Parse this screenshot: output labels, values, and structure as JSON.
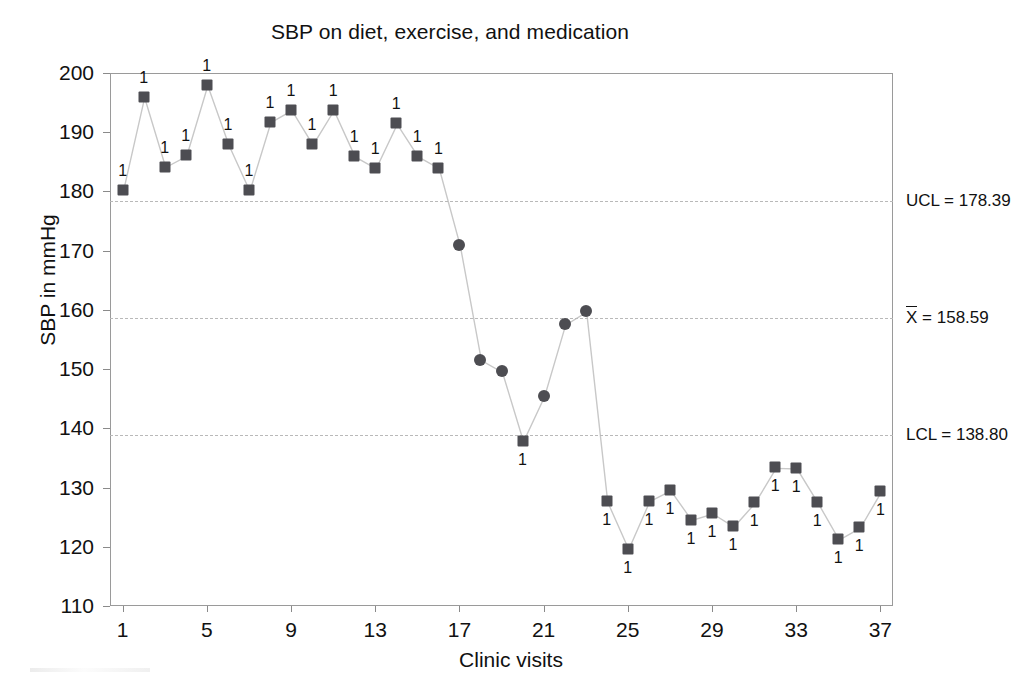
{
  "chart_data": {
    "type": "line",
    "title": "SBP on diet, exercise, and medication",
    "xlabel": "Clinic visits",
    "ylabel": "SBP in mmHg",
    "grid": false,
    "legend": "none",
    "xlim": [
      0.4,
      37.6
    ],
    "ylim": [
      110,
      200
    ],
    "x_ticks": [
      1,
      5,
      9,
      13,
      17,
      21,
      25,
      29,
      33,
      37
    ],
    "y_ticks": [
      110,
      120,
      130,
      140,
      150,
      160,
      170,
      180,
      190,
      200
    ],
    "x": [
      1,
      2,
      3,
      4,
      5,
      6,
      7,
      8,
      9,
      10,
      11,
      12,
      13,
      14,
      15,
      16,
      17,
      18,
      19,
      20,
      21,
      22,
      23,
      24,
      25,
      26,
      27,
      28,
      29,
      30,
      31,
      32,
      33,
      34,
      35,
      36,
      37
    ],
    "values": [
      180.3,
      196.0,
      184.2,
      186.1,
      198.0,
      188.0,
      180.2,
      191.8,
      193.8,
      188.0,
      193.8,
      186.0,
      184.0,
      191.5,
      186.0,
      184.0,
      170.9,
      151.6,
      149.6,
      137.9,
      145.5,
      157.6,
      159.8,
      127.7,
      119.7,
      127.8,
      129.6,
      124.6,
      125.7,
      123.5,
      127.5,
      133.4,
      133.3,
      127.5,
      121.3,
      123.3,
      129.4
    ],
    "point_types": [
      "square",
      "square",
      "square",
      "square",
      "square",
      "square",
      "square",
      "square",
      "square",
      "square",
      "square",
      "square",
      "square",
      "square",
      "square",
      "square",
      "circle",
      "circle",
      "circle",
      "square",
      "circle",
      "circle",
      "circle",
      "square",
      "square",
      "square",
      "square",
      "square",
      "square",
      "square",
      "square",
      "square",
      "square",
      "square",
      "square",
      "square",
      "square"
    ],
    "violation_labels": [
      "1",
      "1",
      "1",
      "1",
      "1",
      "1",
      "1",
      "1",
      "1",
      "1",
      "1",
      "1",
      "1",
      "1",
      "1",
      "1",
      "",
      "",
      "",
      "1",
      "",
      "",
      "",
      "1",
      "1",
      "1",
      "1",
      "1",
      "1",
      "1",
      "1",
      "1",
      "1",
      "1",
      "1",
      "1",
      "1"
    ],
    "violation_label_position": [
      "above",
      "above",
      "above",
      "above",
      "above",
      "above",
      "above",
      "above",
      "above",
      "above",
      "above",
      "above",
      "above",
      "above",
      "above",
      "above",
      "",
      "",
      "",
      "below",
      "",
      "",
      "",
      "below",
      "below",
      "below",
      "below",
      "below",
      "below",
      "below",
      "below",
      "below",
      "below",
      "below",
      "below",
      "below",
      "below"
    ],
    "control_limits": [
      {
        "name": "UCL",
        "label": "UCL = 178.39",
        "value": 178.39
      },
      {
        "name": "CL",
        "label": "X = 158.59",
        "value": 158.59,
        "prefix_bar": true,
        "prefix": "X",
        "suffix": " = 158.59"
      },
      {
        "name": "LCL",
        "label": "LCL = 138.80",
        "value": 138.8
      }
    ],
    "marker_color": "#4d4d52",
    "line_color": "#c8c8c8",
    "limit_line_color": "#b9b9b9",
    "axis_color": "#9a9a9a"
  }
}
